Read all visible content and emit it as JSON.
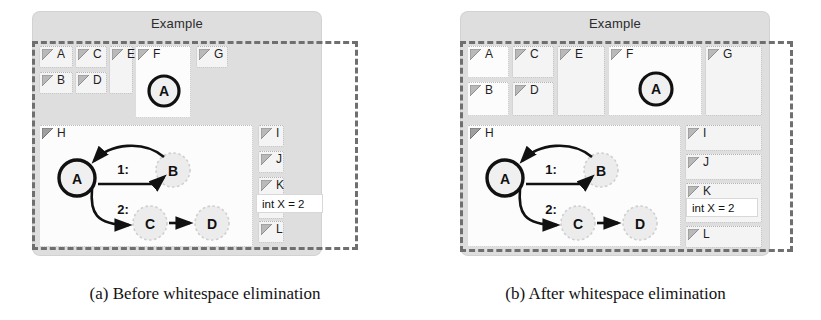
{
  "figures": [
    {
      "id": "a",
      "caption": "(a) Before whitespace elimination",
      "panel_title": "Example",
      "cells": [
        {
          "label": "A"
        },
        {
          "label": "B"
        },
        {
          "label": "C"
        },
        {
          "label": "D"
        },
        {
          "label": "E"
        },
        {
          "label": "F"
        },
        {
          "label": "G"
        },
        {
          "label": "H"
        },
        {
          "label": "I"
        },
        {
          "label": "J"
        },
        {
          "label": "K"
        },
        {
          "label": "L"
        }
      ],
      "node_in_f": "A",
      "watch_expression": "int X = 2",
      "graph": {
        "nodes": [
          {
            "id": "A",
            "label": "A",
            "style": "bold"
          },
          {
            "id": "B",
            "label": "B",
            "style": "ghost"
          },
          {
            "id": "C",
            "label": "C",
            "style": "ghost"
          },
          {
            "id": "D",
            "label": "D",
            "style": "ghost"
          }
        ],
        "edges": [
          {
            "from": "A",
            "to": "B",
            "label": "1:"
          },
          {
            "from": "B",
            "to": "A",
            "label": ""
          },
          {
            "from": "A",
            "to": "C",
            "label": "2:"
          },
          {
            "from": "C",
            "to": "D",
            "label": ""
          }
        ]
      }
    },
    {
      "id": "b",
      "caption": "(b) After whitespace elimination",
      "panel_title": "Example",
      "cells": [
        {
          "label": "A"
        },
        {
          "label": "B"
        },
        {
          "label": "C"
        },
        {
          "label": "D"
        },
        {
          "label": "E"
        },
        {
          "label": "F"
        },
        {
          "label": "G"
        },
        {
          "label": "H"
        },
        {
          "label": "I"
        },
        {
          "label": "J"
        },
        {
          "label": "K"
        },
        {
          "label": "L"
        }
      ],
      "node_in_f": "A",
      "watch_expression": "int X = 2",
      "graph": {
        "nodes": [
          {
            "id": "A",
            "label": "A",
            "style": "bold"
          },
          {
            "id": "B",
            "label": "B",
            "style": "ghost"
          },
          {
            "id": "C",
            "label": "C",
            "style": "ghost"
          },
          {
            "id": "D",
            "label": "D",
            "style": "ghost"
          }
        ],
        "edges": [
          {
            "from": "A",
            "to": "B",
            "label": "1:"
          },
          {
            "from": "B",
            "to": "A",
            "label": ""
          },
          {
            "from": "A",
            "to": "C",
            "label": "2:"
          },
          {
            "from": "C",
            "to": "D",
            "label": ""
          }
        ]
      }
    }
  ],
  "colors": {
    "panel_gray": "#dedede",
    "cell_fill": "#f4f4f4",
    "dashed_stroke": "#6f6f6f",
    "ink": "#111111",
    "ghost_node": "#e9e9e9"
  }
}
